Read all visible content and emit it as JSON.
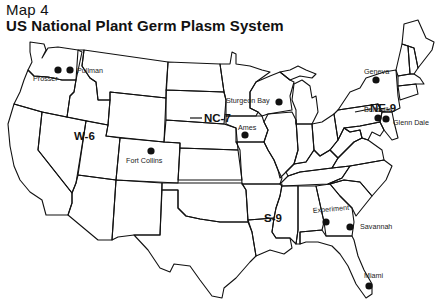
{
  "header": {
    "map_number": "Map 4",
    "title": "US National Plant Germ Plasm System"
  },
  "regions": [
    {
      "id": "W-6",
      "label": "W-6"
    },
    {
      "id": "NC-7",
      "label": "NC-7"
    },
    {
      "id": "NE-9",
      "label": "NE-9"
    },
    {
      "id": "S-9",
      "label": "S-9"
    }
  ],
  "sites": [
    {
      "name": "Prosser",
      "region": "W-6"
    },
    {
      "name": "Pullman",
      "region": "W-6"
    },
    {
      "name": "Fort Collins",
      "region": "W-6"
    },
    {
      "name": "Sturgeon Bay",
      "region": "NC-7"
    },
    {
      "name": "Ames",
      "region": "NC-7"
    },
    {
      "name": "Geneva",
      "region": "NE-9"
    },
    {
      "name": "Beltsville",
      "region": "NE-9"
    },
    {
      "name": "Glenn Dale",
      "region": "NE-9"
    },
    {
      "name": "Experiment",
      "region": "S-9"
    },
    {
      "name": "Savannah",
      "region": "S-9"
    },
    {
      "name": "Miami",
      "region": "S-9"
    }
  ],
  "colors": {
    "ink": "#111111",
    "background": "#ffffff"
  }
}
